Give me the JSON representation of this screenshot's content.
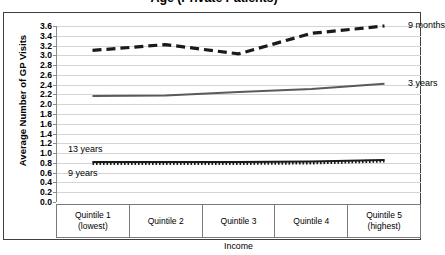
{
  "chart_data": {
    "type": "line",
    "title": "Age (Private Patients)",
    "xlabel": "Income",
    "ylabel": "Average Number of GP Visits",
    "categories": [
      "Quintile 1\n(lowest)",
      "Quintile 2",
      "Quintile 3",
      "Quintile 4",
      "Quintile 5\n(highest)"
    ],
    "category_lines": [
      [
        "Quintile 1",
        "(lowest)"
      ],
      [
        "Quintile 2",
        ""
      ],
      [
        "Quintile 3",
        ""
      ],
      [
        "Quintile 4",
        ""
      ],
      [
        "Quintile 5",
        "(highest)"
      ]
    ],
    "ylim": [
      0.0,
      3.6
    ],
    "ytick_labels": [
      "3.6",
      "3.4",
      "3.2",
      "3.0",
      "2.8",
      "2.6",
      "2.4",
      "2.2",
      "2.0",
      "1.8",
      "1.6",
      "1.4",
      "1.2",
      "1.0",
      "0.8",
      "0.6",
      "0.4",
      "0.2",
      "0.0"
    ],
    "ytick_values": [
      3.6,
      3.4,
      3.2,
      3.0,
      2.8,
      2.6,
      2.4,
      2.2,
      2.0,
      1.8,
      1.6,
      1.4,
      1.2,
      1.0,
      0.8,
      0.6,
      0.4,
      0.2,
      0.0
    ],
    "grid": true,
    "legend_position": "inline-series-labels",
    "series": [
      {
        "name": "9 months",
        "values": [
          3.1,
          3.22,
          3.03,
          3.45,
          3.6
        ],
        "style": "dashed",
        "color": "#1a1a1a",
        "label_x": 352,
        "label_y": 3.6
      },
      {
        "name": "3 years",
        "values": [
          2.17,
          2.18,
          2.25,
          2.31,
          2.42
        ],
        "style": "solid",
        "color": "#5a5a5a",
        "label_x": 352,
        "label_y": 2.42
      },
      {
        "name": "13 years",
        "values": [
          0.82,
          0.82,
          0.82,
          0.83,
          0.86
        ],
        "style": "solid",
        "color": "#1a1a1a",
        "label_x": 12,
        "label_y": 1.06
      },
      {
        "name": "9 years",
        "values": [
          0.79,
          0.79,
          0.79,
          0.8,
          0.84
        ],
        "style": "dotted",
        "color": "#1a1a1a",
        "label_x": 12,
        "label_y": 0.58
      }
    ]
  }
}
